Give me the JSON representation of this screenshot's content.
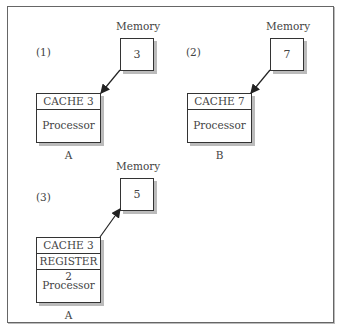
{
  "caption_fragment": "... y                      g",
  "panels": [
    {
      "label": "(1)",
      "memory": {
        "label": "Memory",
        "value": "3"
      },
      "processor": {
        "rows": [
          "CACHE 3",
          "Processor A"
        ]
      },
      "arrow": "memory-to-processor"
    },
    {
      "label": "(2)",
      "memory": {
        "label": "Memory",
        "value": "7"
      },
      "processor": {
        "rows": [
          "CACHE 7",
          "Processor B"
        ]
      },
      "arrow": "memory-to-processor"
    },
    {
      "label": "(3)",
      "memory": {
        "label": "Memory",
        "value": "5"
      },
      "processor": {
        "rows": [
          "CACHE 3",
          "REGISTER 2",
          "Processor A"
        ]
      },
      "arrow": "processor-to-memory"
    }
  ]
}
